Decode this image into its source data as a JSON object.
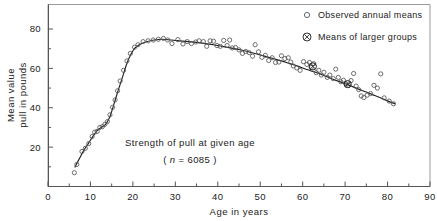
{
  "figure": {
    "background_color": "#ffffff",
    "frame_color": "#8f8f8f",
    "axis_color": "#555555",
    "marker_color": "#555555",
    "curve_color": "#222222",
    "text_color": "#222222"
  },
  "annotation": {
    "line1": "Strength of pull at given age",
    "line2_prefix": "( ",
    "line2_italic": "n",
    "line2_suffix": " = 6085 )"
  },
  "legend": {
    "entries": [
      {
        "label": "Observed annual means",
        "marker": "open-circle-icon"
      },
      {
        "label": "Means of larger groups",
        "marker": "crossed-circle-icon"
      }
    ]
  },
  "chart_data": {
    "type": "scatter",
    "title": "Strength of pull at given age",
    "subtitle": "( n = 6085 )",
    "xlabel": "Age in years",
    "ylabel": "Mean value\npull in pounds",
    "ylabel_lines": [
      "Mean value",
      "pull in pounds"
    ],
    "xlim": [
      0,
      90
    ],
    "ylim": [
      0,
      88
    ],
    "grid": false,
    "legend_position": "top-right",
    "xticks": [
      0,
      10,
      20,
      30,
      40,
      50,
      60,
      70,
      80,
      90
    ],
    "xtick_labels": [
      "0",
      "10",
      "20",
      "30",
      "40",
      "50",
      "60",
      "70",
      "80",
      "90"
    ],
    "xminor_ticks": [
      5,
      15,
      25,
      35,
      45,
      55,
      65,
      75,
      85
    ],
    "yticks": [
      20,
      40,
      60,
      80
    ],
    "ytick_labels": [
      "20",
      "40",
      "60",
      "80"
    ],
    "yminor_ticks": [
      10,
      30,
      50,
      70
    ],
    "series": [
      {
        "name": "Observed annual means",
        "marker": "open-circle",
        "points": [
          [
            6.2,
            7.0
          ],
          [
            6.8,
            11.2
          ],
          [
            8.0,
            17.8
          ],
          [
            8.8,
            19.4
          ],
          [
            9.6,
            21.8
          ],
          [
            10.4,
            25.4
          ],
          [
            11.0,
            27.6
          ],
          [
            11.6,
            28.0
          ],
          [
            12.2,
            30.0
          ],
          [
            12.8,
            30.4
          ],
          [
            13.4,
            31.6
          ],
          [
            14.0,
            33.0
          ],
          [
            14.6,
            36.4
          ],
          [
            15.2,
            40.2
          ],
          [
            15.8,
            44.0
          ],
          [
            16.4,
            48.6
          ],
          [
            17.0,
            53.6
          ],
          [
            17.8,
            59.0
          ],
          [
            18.6,
            63.8
          ],
          [
            19.4,
            67.6
          ],
          [
            20.4,
            70.8
          ],
          [
            21.2,
            72.0
          ],
          [
            22.4,
            73.6
          ],
          [
            23.6,
            74.0
          ],
          [
            24.8,
            74.4
          ],
          [
            26.0,
            74.8
          ],
          [
            27.2,
            75.2
          ],
          [
            28.2,
            74.4
          ],
          [
            29.2,
            72.6
          ],
          [
            30.6,
            74.6
          ],
          [
            31.8,
            72.4
          ],
          [
            32.8,
            73.6
          ],
          [
            33.8,
            72.6
          ],
          [
            34.8,
            73.4
          ],
          [
            35.6,
            74.0
          ],
          [
            36.6,
            73.6
          ],
          [
            37.4,
            71.2
          ],
          [
            38.2,
            74.0
          ],
          [
            39.0,
            73.8
          ],
          [
            39.8,
            71.6
          ],
          [
            40.6,
            71.2
          ],
          [
            41.4,
            74.2
          ],
          [
            42.2,
            71.6
          ],
          [
            42.8,
            74.4
          ],
          [
            43.4,
            70.4
          ],
          [
            44.2,
            70.6
          ],
          [
            45.0,
            69.4
          ],
          [
            45.8,
            67.6
          ],
          [
            46.6,
            68.6
          ],
          [
            47.4,
            68.0
          ],
          [
            48.2,
            66.2
          ],
          [
            48.8,
            72.0
          ],
          [
            49.6,
            68.4
          ],
          [
            50.4,
            65.6
          ],
          [
            51.2,
            66.6
          ],
          [
            52.0,
            64.0
          ],
          [
            52.8,
            65.4
          ],
          [
            53.6,
            63.0
          ],
          [
            54.4,
            63.2
          ],
          [
            55.0,
            66.4
          ],
          [
            55.8,
            65.0
          ],
          [
            56.6,
            65.4
          ],
          [
            57.2,
            63.2
          ],
          [
            57.8,
            61.2
          ],
          [
            58.6,
            60.2
          ],
          [
            59.4,
            59.0
          ],
          [
            60.2,
            63.4
          ],
          [
            61.0,
            62.0
          ],
          [
            61.6,
            63.0
          ],
          [
            62.0,
            60.4
          ],
          [
            62.6,
            62.4
          ],
          [
            63.2,
            57.8
          ],
          [
            63.8,
            59.0
          ],
          [
            64.4,
            56.6
          ],
          [
            65.0,
            58.0
          ],
          [
            65.8,
            55.4
          ],
          [
            66.4,
            56.6
          ],
          [
            67.2,
            54.8
          ],
          [
            67.8,
            59.6
          ],
          [
            68.4,
            55.4
          ],
          [
            69.0,
            53.2
          ],
          [
            69.6,
            54.0
          ],
          [
            70.2,
            52.2
          ],
          [
            70.8,
            51.4
          ],
          [
            71.4,
            53.8
          ],
          [
            72.0,
            57.4
          ],
          [
            72.6,
            51.0
          ],
          [
            73.2,
            49.2
          ],
          [
            73.8,
            46.0
          ],
          [
            74.4,
            45.2
          ],
          [
            75.2,
            46.4
          ],
          [
            76.0,
            47.2
          ],
          [
            76.8,
            51.4
          ],
          [
            77.6,
            50.0
          ],
          [
            78.4,
            57.2
          ],
          [
            79.2,
            45.0
          ],
          [
            80.4,
            43.4
          ],
          [
            81.4,
            42.0
          ]
        ]
      },
      {
        "name": "Means of larger groups",
        "marker": "crossed-circle",
        "points": [
          [
            62.4,
            61.0
          ],
          [
            70.6,
            52.0
          ]
        ]
      }
    ],
    "fitted_curve": {
      "name": "Fitted trend",
      "points": [
        [
          6.3,
          9.6
        ],
        [
          7.5,
          14.6
        ],
        [
          8.5,
          18.6
        ],
        [
          9.5,
          21.8
        ],
        [
          10.5,
          25.2
        ],
        [
          11.5,
          28.2
        ],
        [
          12.5,
          30.0
        ],
        [
          13.5,
          31.4
        ],
        [
          14.5,
          35.0
        ],
        [
          15.5,
          41.6
        ],
        [
          16.5,
          48.6
        ],
        [
          17.5,
          55.2
        ],
        [
          18.5,
          62.0
        ],
        [
          19.5,
          67.0
        ],
        [
          20.5,
          70.4
        ],
        [
          21.5,
          72.0
        ],
        [
          23.0,
          73.4
        ],
        [
          25.0,
          74.4
        ],
        [
          27.0,
          74.8
        ],
        [
          29.0,
          74.4
        ],
        [
          31.0,
          74.0
        ],
        [
          33.0,
          73.6
        ],
        [
          35.0,
          73.2
        ],
        [
          37.0,
          72.6
        ],
        [
          39.0,
          72.0
        ],
        [
          41.0,
          71.2
        ],
        [
          43.0,
          70.4
        ],
        [
          45.0,
          69.6
        ],
        [
          47.0,
          68.6
        ],
        [
          49.0,
          67.4
        ],
        [
          51.0,
          66.2
        ],
        [
          53.0,
          65.0
        ],
        [
          55.0,
          63.8
        ],
        [
          57.0,
          62.4
        ],
        [
          59.0,
          61.0
        ],
        [
          61.0,
          59.4
        ],
        [
          63.0,
          58.0
        ],
        [
          65.0,
          56.4
        ],
        [
          67.0,
          54.6
        ],
        [
          69.0,
          53.0
        ],
        [
          71.0,
          51.4
        ],
        [
          73.0,
          49.6
        ],
        [
          75.0,
          48.0
        ],
        [
          77.0,
          46.2
        ],
        [
          79.0,
          44.4
        ],
        [
          81.0,
          42.6
        ],
        [
          81.8,
          42.0
        ]
      ]
    }
  }
}
